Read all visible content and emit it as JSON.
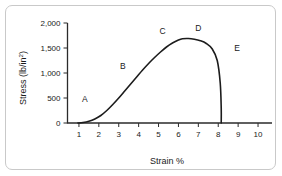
{
  "chart_data": {
    "type": "line",
    "title": "",
    "xlabel": "Strain %",
    "ylabel": "Stress (lb/in",
    "ylabel_superscript": "2",
    "ylabel_suffix": ")",
    "xlim": [
      0.4,
      10.4
    ],
    "ylim": [
      0,
      2000
    ],
    "grid": false,
    "legend": null,
    "x_ticks": [
      "1",
      "2",
      "3",
      "4",
      "5",
      "6",
      "7",
      "8",
      "9",
      "10"
    ],
    "x_tick_values": [
      1,
      2,
      3,
      4,
      5,
      6,
      7,
      8,
      9,
      10
    ],
    "y_ticks": [
      "0",
      "500",
      "1,000",
      "1,500",
      "2,000"
    ],
    "y_tick_values": [
      0,
      500,
      1000,
      1500,
      2000
    ],
    "series": [
      {
        "name": "stress-strain-curve",
        "color": "#1c1c1c",
        "x": [
          0.95,
          1.2,
          1.5,
          1.8,
          2.1,
          2.4,
          2.7,
          3.0,
          3.3,
          3.6,
          3.9,
          4.2,
          4.5,
          4.8,
          5.1,
          5.4,
          5.7,
          6.0,
          6.2,
          6.5,
          6.8,
          7.1,
          7.4,
          7.7,
          7.95,
          8.1,
          8.15,
          8.15
        ],
        "y": [
          0,
          10,
          35,
          80,
          150,
          250,
          370,
          500,
          640,
          780,
          920,
          1060,
          1190,
          1310,
          1420,
          1520,
          1600,
          1660,
          1685,
          1690,
          1675,
          1645,
          1590,
          1480,
          1250,
          800,
          300,
          0
        ]
      }
    ],
    "annotations": [
      {
        "label": "A",
        "x": 1.3,
        "y": 420
      },
      {
        "label": "B",
        "x": 3.2,
        "y": 1080
      },
      {
        "label": "C",
        "x": 5.2,
        "y": 1790
      },
      {
        "label": "D",
        "x": 7.0,
        "y": 1840
      },
      {
        "label": "E",
        "x": 8.95,
        "y": 1440
      }
    ]
  },
  "figure": {
    "border_color": "#c9c9c9",
    "axis_color": "#2b2b2b",
    "background": "#ffffff"
  }
}
